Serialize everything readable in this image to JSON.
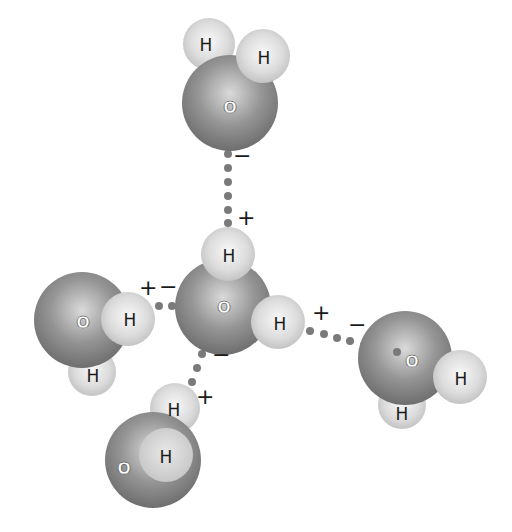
{
  "diagram": {
    "type": "water hydrogen-bonding tetrahedron",
    "colors": {
      "oxygen": "#8a8a8a",
      "oxygen_highlight": "#d8d8d8",
      "hydrogen": "#d4d4d4",
      "hydrogen_highlight": "#f6f6f6",
      "bond_dots": "#7a7a7a",
      "text": "#1a1a1a"
    },
    "atom_labels": {
      "oxygen": "O",
      "hydrogen": "H"
    },
    "charges": {
      "positive": "+",
      "negative": "−"
    },
    "molecules": [
      {
        "id": "top",
        "O": [
          230,
          103
        ],
        "H": [
          [
            209,
            44
          ],
          [
            263,
            56
          ]
        ]
      },
      {
        "id": "center",
        "O": [
          223,
          307
        ],
        "H": [
          [
            228,
            254
          ],
          [
            278,
            322
          ]
        ]
      },
      {
        "id": "left",
        "O": [
          82,
          320
        ],
        "H": [
          [
            128,
            319
          ],
          [
            92,
            374
          ]
        ]
      },
      {
        "id": "right",
        "O": [
          405,
          358
        ],
        "H": [
          [
            460,
            377
          ],
          [
            402,
            412
          ]
        ]
      },
      {
        "id": "bottom",
        "O": [
          153,
          462
        ],
        "H": [
          [
            173,
            406
          ],
          [
            166,
            455
          ]
        ]
      }
    ],
    "bonds": [
      {
        "from": [
          228,
          152
        ],
        "to": [
          228,
          248
        ],
        "labels": [
          {
            "text": "−",
            "x": 240,
            "y": 160
          },
          {
            "text": "+",
            "x": 245,
            "y": 220
          }
        ]
      },
      {
        "from": [
          156,
          305
        ],
        "to": [
          174,
          306
        ],
        "labels": [
          {
            "text": "+",
            "x": 147,
            "y": 289
          },
          {
            "text": "−",
            "x": 168,
            "y": 289
          }
        ]
      },
      {
        "from": [
          310,
          330
        ],
        "to": [
          400,
          355
        ],
        "labels": [
          {
            "text": "+",
            "x": 320,
            "y": 315
          },
          {
            "text": "−",
            "x": 357,
            "y": 324
          }
        ]
      },
      {
        "from": [
          203,
          355
        ],
        "to": [
          184,
          398
        ],
        "labels": [
          {
            "text": "−",
            "x": 220,
            "y": 355
          },
          {
            "text": "+",
            "x": 205,
            "y": 400
          }
        ]
      }
    ]
  }
}
